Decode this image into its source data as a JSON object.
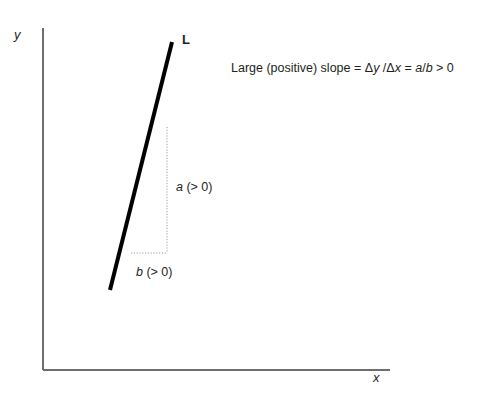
{
  "figure": {
    "type": "line-slope-diagram",
    "background_color": "#ffffff",
    "ink_color": "#231f20",
    "axes": {
      "y_label": "y",
      "x_label": "x",
      "axis_color": "#6d6e71",
      "origin": [
        43,
        370
      ],
      "y_axis_top": [
        43,
        28
      ],
      "x_axis_right": [
        390,
        370
      ]
    },
    "line": {
      "name": "L",
      "label": "L",
      "color": "#000000",
      "thickness_px": 4,
      "start": [
        110,
        290
      ],
      "end": [
        172,
        42
      ]
    },
    "rise": {
      "label_var": "a",
      "label_condition": " (> 0)",
      "full_label": "a (> 0)",
      "from": [
        167,
        127
      ],
      "to": [
        167,
        253
      ]
    },
    "run": {
      "label_var": "b",
      "label_condition": " (> 0)",
      "full_label": "b (> 0)",
      "from": [
        131,
        253
      ],
      "to": [
        167,
        253
      ]
    },
    "guide_color": "#9a9a9a",
    "annotation": {
      "prefix": "Large (positive) slope = ",
      "delta_y": "Δy",
      "separator_1": " /",
      "delta_x": "Δx",
      "equals": " = ",
      "numerator": "a",
      "fraction_slash": "/",
      "denominator": "b",
      "suffix": " > 0",
      "full_text": "Large (positive) slope = Δy /Δx = a/b > 0"
    }
  }
}
